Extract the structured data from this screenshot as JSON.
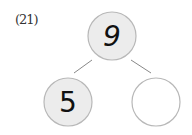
{
  "problem": {
    "label": "(21)",
    "whole": "9",
    "parts": [
      "5",
      ""
    ]
  },
  "colors": {
    "filled_circle": "#ececec",
    "empty_circle": "#ffffff",
    "circle_stroke": "#b8b8b8",
    "line": "#888888"
  }
}
